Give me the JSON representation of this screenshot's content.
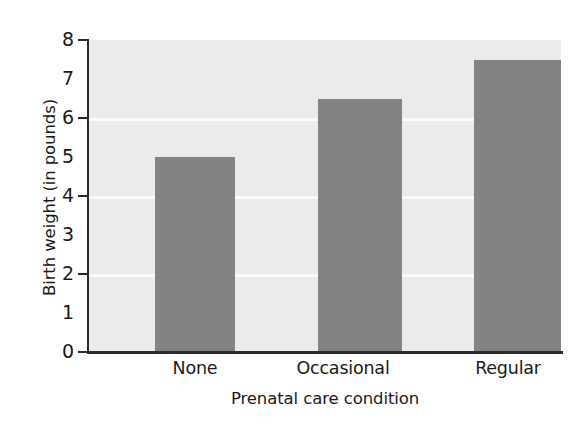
{
  "chart_data": {
    "type": "bar",
    "title": "",
    "subtitle": "",
    "categories": [
      "None",
      "Occasional",
      "Regular"
    ],
    "values": [
      5.0,
      6.5,
      7.5
    ],
    "series": [
      {
        "name": "Birth weight",
        "values": [
          5.0,
          6.5,
          7.5
        ]
      }
    ],
    "xlabel": "Prenatal care condition",
    "ylabel": "Birth weight (in pounds)",
    "ylim": [
      0,
      8
    ],
    "y_ticks": [
      0,
      1,
      2,
      3,
      4,
      5,
      6,
      7,
      8
    ],
    "y_tick_labels": [
      "0",
      "1",
      "2",
      "3",
      "4",
      "5",
      "6",
      "7",
      "8"
    ],
    "y_tick_marks_at": [
      0,
      2,
      4,
      6,
      8
    ],
    "gridlines": [
      2,
      4,
      6
    ],
    "grid": true,
    "legend": "none",
    "legend_position": "none",
    "annotations": [],
    "colors": {
      "bar_fill": "#838383",
      "plot_background": "#ebebeb",
      "gridline": "#fbfbfb",
      "axis_line": "#2b2b2b",
      "text": "#1a1a1a",
      "figure_background": "#ffffff"
    }
  },
  "axes": {
    "y_title": "Birth weight (in pounds)",
    "x_title": "Prenatal care condition"
  }
}
